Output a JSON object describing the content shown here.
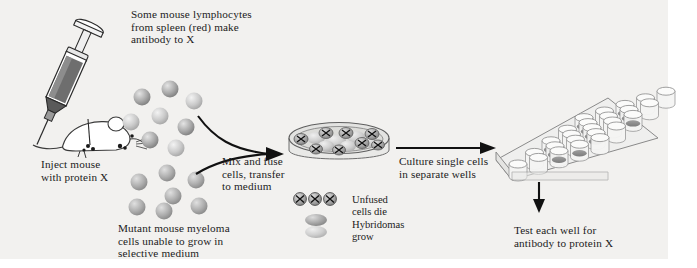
{
  "figure": {
    "background_color": "#f2f1ef",
    "page_color": "#ffffff",
    "ink_color": "#1b1b1b"
  },
  "captions": {
    "lymphocytes": "Some mouse lymphocytes\nfrom spleen (red) make\nantibody to X",
    "inject": "Inject mouse\nwith protein X",
    "myeloma": "Mutant mouse myeloma\ncells unable to grow in\nselective medium",
    "mix_fuse": "Mix and fuse\ncells, transfer\nto medium",
    "culture": "Culture single cells\nin separate wells",
    "test": "Test each well for\nantibody to protein X"
  },
  "legend": {
    "unfused": "Unfused\ncells die",
    "hybridomas": "Hybridomas\ngrow"
  },
  "icons": {
    "syringe": "syringe-icon",
    "mouse": "mouse-icon",
    "petri_dish": "petri-dish-icon",
    "well_plate": "well-plate-icon",
    "arrow_right": "arrow-right-icon",
    "arrow_down": "arrow-down-icon"
  },
  "cells": {
    "lymphocyte_colors": [
      "#9a9a9a",
      "#b3b3b3",
      "#8f8f8f",
      "#c8c8c8",
      "#a6a6a6",
      "#9a9a9a",
      "#b9b9b9",
      "#a0a0a0"
    ],
    "lymphocyte_positions": [
      [
        142,
        97
      ],
      [
        170,
        89
      ],
      [
        194,
        101
      ],
      [
        160,
        116
      ],
      [
        131,
        122
      ],
      [
        186,
        127
      ],
      [
        150,
        140
      ],
      [
        176,
        148
      ]
    ],
    "myeloma_colors": [
      "#a8a8a8",
      "#9d9d9d",
      "#aeaeae",
      "#a3a3a3",
      "#b0b0b0",
      "#a8a8a8",
      "#a0a0a0"
    ],
    "myeloma_positions": [
      [
        139,
        182
      ],
      [
        167,
        173
      ],
      [
        196,
        180
      ],
      [
        173,
        196
      ],
      [
        137,
        207
      ],
      [
        164,
        211
      ],
      [
        199,
        206
      ]
    ],
    "dish_unfused_count": 8,
    "dish_hybridoma_count": 6,
    "plate_rows": 5,
    "plate_cols": 5
  }
}
